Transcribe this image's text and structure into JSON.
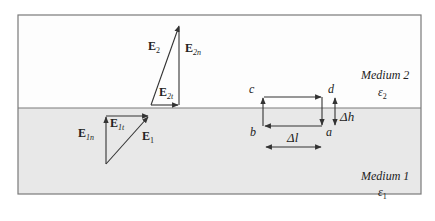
{
  "figure": {
    "colors": {
      "medium2_fill": "#fdfdfd",
      "medium1_fill": "#e8e8e8",
      "border": "#7a7a7a",
      "line": "#333333"
    },
    "medium2": {
      "name": "Medium 2",
      "permittivity": "ε",
      "permittivity_sub": "2"
    },
    "medium1": {
      "name": "Medium 1",
      "permittivity": "ε",
      "permittivity_sub": "1"
    },
    "vectors_medium2": {
      "total": {
        "symbol": "E",
        "sub": "2"
      },
      "normal": {
        "symbol": "E",
        "sub": "2n"
      },
      "tangential": {
        "symbol": "E",
        "sub": "2t"
      }
    },
    "vectors_medium1": {
      "total": {
        "symbol": "E",
        "sub": "1"
      },
      "normal": {
        "symbol": "E",
        "sub": "1n"
      },
      "tangential": {
        "symbol": "E",
        "sub": "1t"
      }
    },
    "loop": {
      "corners": {
        "a": "a",
        "b": "b",
        "c": "c",
        "d": "d"
      },
      "height": "Δh",
      "length": "Δl"
    }
  }
}
